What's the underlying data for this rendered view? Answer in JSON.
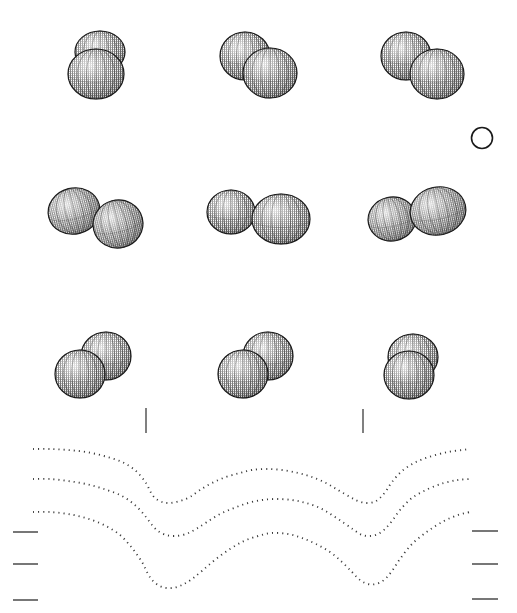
{
  "figure": {
    "title": "",
    "background_color": "#ffffff",
    "width": 517,
    "height": 613,
    "stipple_color": "#222222",
    "outline_color": "#1a1a1a",
    "dot_color": "#3a3a3a",
    "tick_color": "#4a4a4a"
  },
  "sphere_pairs": [
    {
      "id": "pair-r1c1",
      "row": 1,
      "column": 1,
      "label": "vertical-stacked-overlapping-dimer",
      "spheres": [
        {
          "cx": 100,
          "cy": 52,
          "rx": 25,
          "ry": 21,
          "rotation": 0,
          "z": 1
        },
        {
          "cx": 96,
          "cy": 74,
          "rx": 28,
          "ry": 25,
          "rotation": 0,
          "z": 2
        }
      ]
    },
    {
      "id": "pair-r1c2",
      "row": 1,
      "column": 2,
      "label": "diagonal-overlapping-dimer",
      "spheres": [
        {
          "cx": 245,
          "cy": 56,
          "rx": 25,
          "ry": 24,
          "rotation": 0,
          "z": 1
        },
        {
          "cx": 270,
          "cy": 73,
          "rx": 27,
          "ry": 25,
          "rotation": 0,
          "z": 2
        }
      ]
    },
    {
      "id": "pair-r1c3",
      "row": 1,
      "column": 3,
      "label": "diagonal-touching-dimer",
      "spheres": [
        {
          "cx": 406,
          "cy": 56,
          "rx": 25,
          "ry": 24,
          "rotation": 0,
          "z": 1
        },
        {
          "cx": 437,
          "cy": 74,
          "rx": 27,
          "ry": 25,
          "rotation": 0,
          "z": 2
        }
      ]
    },
    {
      "id": "pair-r2c1",
      "row": 2,
      "column": 1,
      "label": "horizontal-tilted-dimer",
      "spheres": [
        {
          "cx": 74,
          "cy": 211,
          "rx": 26,
          "ry": 23,
          "rotation": -14,
          "z": 1
        },
        {
          "cx": 118,
          "cy": 224,
          "rx": 25,
          "ry": 24,
          "rotation": -14,
          "z": 2
        }
      ]
    },
    {
      "id": "pair-r2c2",
      "row": 2,
      "column": 2,
      "label": "horizontal-separated-dimer",
      "spheres": [
        {
          "cx": 231,
          "cy": 212,
          "rx": 24,
          "ry": 22,
          "rotation": 0,
          "z": 1
        },
        {
          "cx": 281,
          "cy": 219,
          "rx": 29,
          "ry": 25,
          "rotation": 0,
          "z": 2
        }
      ]
    },
    {
      "id": "pair-r2c3",
      "row": 2,
      "column": 3,
      "label": "horizontal-offset-dimer",
      "spheres": [
        {
          "cx": 392,
          "cy": 219,
          "rx": 24,
          "ry": 22,
          "rotation": -12,
          "z": 1
        },
        {
          "cx": 438,
          "cy": 211,
          "rx": 28,
          "ry": 24,
          "rotation": -12,
          "z": 2
        }
      ]
    },
    {
      "id": "pair-r3c1",
      "row": 3,
      "column": 1,
      "label": "diagonal-ascending-dimer",
      "spheres": [
        {
          "cx": 106,
          "cy": 356,
          "rx": 25,
          "ry": 24,
          "rotation": 0,
          "z": 1
        },
        {
          "cx": 80,
          "cy": 374,
          "rx": 25,
          "ry": 24,
          "rotation": 0,
          "z": 2
        }
      ]
    },
    {
      "id": "pair-r3c2",
      "row": 3,
      "column": 2,
      "label": "diagonal-ascending-dimer-2",
      "spheres": [
        {
          "cx": 268,
          "cy": 356,
          "rx": 25,
          "ry": 24,
          "rotation": 0,
          "z": 1
        },
        {
          "cx": 243,
          "cy": 374,
          "rx": 25,
          "ry": 24,
          "rotation": 0,
          "z": 2
        }
      ]
    },
    {
      "id": "pair-r3c3",
      "row": 3,
      "column": 3,
      "label": "vertical-stacked-dimer",
      "spheres": [
        {
          "cx": 413,
          "cy": 357,
          "rx": 25,
          "ry": 23,
          "rotation": 0,
          "z": 1
        },
        {
          "cx": 409,
          "cy": 375,
          "rx": 25,
          "ry": 24,
          "rotation": 0,
          "z": 2
        }
      ]
    }
  ],
  "reference_circle": {
    "id": "reference-circle",
    "label": "open-reference-circle",
    "cx": 482,
    "cy": 138,
    "r": 10.5,
    "filled": false,
    "stroke": "#1a1a1a",
    "stroke_width": 1.6
  },
  "vertical_ticks": [
    {
      "id": "vtick-1",
      "x": 146,
      "y1": 408,
      "y2": 433
    },
    {
      "id": "vtick-2",
      "x": 363,
      "y1": 409,
      "y2": 433
    }
  ],
  "left_ticks": [
    {
      "id": "ltick-1",
      "x1": 13,
      "x2": 38,
      "y": 532
    },
    {
      "id": "ltick-2",
      "x1": 13,
      "x2": 38,
      "y": 564
    },
    {
      "id": "ltick-3",
      "x1": 13,
      "x2": 38,
      "y": 600
    }
  ],
  "right_ticks": [
    {
      "id": "rtick-1",
      "x1": 472,
      "x2": 498,
      "y": 531
    },
    {
      "id": "rtick-2",
      "x1": 472,
      "x2": 498,
      "y": 564
    },
    {
      "id": "rtick-3",
      "x1": 472,
      "x2": 498,
      "y": 599
    }
  ],
  "chart_data": {
    "type": "line",
    "title": "",
    "subtitle": "",
    "xlabel": "",
    "ylabel": "",
    "grid": false,
    "legend": "none",
    "line_style": "dotted",
    "marker": "square-dot",
    "marker_size": 1.6,
    "xlim": [
      33,
      470
    ],
    "ylim": [
      590,
      444
    ],
    "note": "Three dotted double-well (W shaped) curves; x is position across panel, y is screen-pixel height (smaller y = higher on page).",
    "series": [
      {
        "name": "curve-top",
        "points": [
          [
            33,
            449
          ],
          [
            50,
            449
          ],
          [
            68,
            450
          ],
          [
            86,
            452
          ],
          [
            104,
            456
          ],
          [
            122,
            462
          ],
          [
            136,
            471
          ],
          [
            146,
            483
          ],
          [
            150,
            491
          ],
          [
            155,
            498
          ],
          [
            162,
            502
          ],
          [
            170,
            503
          ],
          [
            180,
            501
          ],
          [
            190,
            497
          ],
          [
            200,
            490
          ],
          [
            212,
            483
          ],
          [
            226,
            477
          ],
          [
            240,
            473
          ],
          [
            252,
            470
          ],
          [
            266,
            469
          ],
          [
            282,
            470
          ],
          [
            298,
            473
          ],
          [
            312,
            477
          ],
          [
            326,
            483
          ],
          [
            338,
            490
          ],
          [
            350,
            497
          ],
          [
            358,
            501
          ],
          [
            366,
            503
          ],
          [
            374,
            502
          ],
          [
            380,
            498
          ],
          [
            386,
            491
          ],
          [
            392,
            482
          ],
          [
            402,
            471
          ],
          [
            416,
            462
          ],
          [
            432,
            456
          ],
          [
            448,
            452
          ],
          [
            462,
            450
          ],
          [
            470,
            449
          ]
        ]
      },
      {
        "name": "curve-middle",
        "points": [
          [
            33,
            479
          ],
          [
            50,
            479
          ],
          [
            68,
            481
          ],
          [
            86,
            484
          ],
          [
            104,
            489
          ],
          [
            122,
            496
          ],
          [
            136,
            506
          ],
          [
            146,
            517
          ],
          [
            152,
            525
          ],
          [
            158,
            531
          ],
          [
            166,
            535
          ],
          [
            175,
            536
          ],
          [
            186,
            534
          ],
          [
            196,
            529
          ],
          [
            207,
            522
          ],
          [
            220,
            514
          ],
          [
            234,
            508
          ],
          [
            248,
            503
          ],
          [
            262,
            500
          ],
          [
            276,
            499
          ],
          [
            292,
            500
          ],
          [
            306,
            503
          ],
          [
            320,
            508
          ],
          [
            332,
            515
          ],
          [
            344,
            523
          ],
          [
            354,
            530
          ],
          [
            362,
            535
          ],
          [
            370,
            536
          ],
          [
            378,
            534
          ],
          [
            385,
            529
          ],
          [
            392,
            521
          ],
          [
            400,
            510
          ],
          [
            412,
            498
          ],
          [
            428,
            489
          ],
          [
            444,
            483
          ],
          [
            458,
            480
          ],
          [
            470,
            479
          ]
        ]
      },
      {
        "name": "curve-bottom",
        "points": [
          [
            33,
            512
          ],
          [
            50,
            512
          ],
          [
            68,
            514
          ],
          [
            86,
            518
          ],
          [
            104,
            525
          ],
          [
            120,
            535
          ],
          [
            132,
            548
          ],
          [
            142,
            562
          ],
          [
            148,
            574
          ],
          [
            154,
            582
          ],
          [
            162,
            587
          ],
          [
            172,
            588
          ],
          [
            182,
            585
          ],
          [
            192,
            579
          ],
          [
            203,
            570
          ],
          [
            216,
            559
          ],
          [
            230,
            549
          ],
          [
            244,
            541
          ],
          [
            258,
            536
          ],
          [
            272,
            533
          ],
          [
            288,
            534
          ],
          [
            302,
            538
          ],
          [
            316,
            544
          ],
          [
            330,
            552
          ],
          [
            342,
            562
          ],
          [
            352,
            572
          ],
          [
            360,
            580
          ],
          [
            368,
            584
          ],
          [
            376,
            584
          ],
          [
            384,
            580
          ],
          [
            392,
            571
          ],
          [
            400,
            559
          ],
          [
            412,
            544
          ],
          [
            428,
            531
          ],
          [
            444,
            521
          ],
          [
            458,
            515
          ],
          [
            470,
            512
          ]
        ]
      }
    ]
  }
}
